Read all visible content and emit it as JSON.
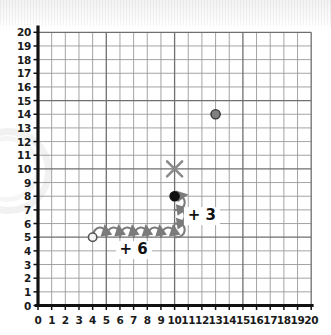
{
  "figure": {
    "background_color": "#ffffff",
    "grid_color": "#8a8a8a",
    "axis_color": "#111111",
    "arrow_color": "#7b7b7b",
    "marker_dark": "#111111",
    "marker_gray": "#808080"
  },
  "axes": {
    "x_label": "",
    "y_label": "",
    "x_ticks": [
      "0",
      "1",
      "2",
      "3",
      "4",
      "5",
      "6",
      "7",
      "8",
      "9",
      "10",
      "11",
      "12",
      "13",
      "14",
      "15",
      "16",
      "17",
      "18",
      "19",
      "20"
    ],
    "y_ticks": [
      "0",
      "1",
      "2",
      "3",
      "4",
      "5",
      "6",
      "7",
      "8",
      "9",
      "10",
      "11",
      "12",
      "13",
      "14",
      "15",
      "16",
      "17",
      "18",
      "19",
      "20"
    ],
    "xlim": [
      0,
      20
    ],
    "ylim": [
      0,
      20
    ]
  },
  "annotations": {
    "horizontal_label": "+ 6",
    "vertical_label": "+ 3"
  },
  "chart_data": {
    "type": "scatter",
    "title": "",
    "xlabel": "",
    "ylabel": "",
    "xlim": [
      0,
      20
    ],
    "ylim": [
      0,
      20
    ],
    "grid": true,
    "legend": "none",
    "points": [
      {
        "name": "start-point",
        "x": 4,
        "y": 5,
        "marker": "open-circle",
        "color": "#f5f5f5",
        "edge": "#555555"
      },
      {
        "name": "translated-point",
        "x": 10,
        "y": 8,
        "marker": "filled-circle",
        "color": "#111111",
        "edge": "#111111"
      },
      {
        "name": "cross-point",
        "x": 10,
        "y": 10,
        "marker": "x",
        "color": "#8a8a8a",
        "edge": "#8a8a8a"
      },
      {
        "name": "distractor-point",
        "x": 13,
        "y": 14,
        "marker": "filled-circle",
        "color": "#808080",
        "edge": "#333333"
      }
    ],
    "translation": {
      "from": [
        4,
        5
      ],
      "to": [
        10,
        8
      ],
      "dx": 6,
      "dy": 3,
      "horizontal_hops": 6,
      "vertical_hops": 3,
      "dx_label": "+ 6",
      "dy_label": "+ 3"
    }
  }
}
